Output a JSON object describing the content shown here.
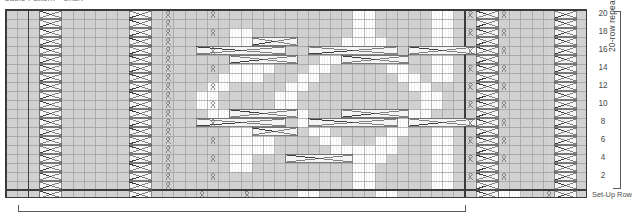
{
  "caption": "Cable Pattern - Chart",
  "chart_data": {
    "type": "table",
    "title": "Cable Pattern - Chart",
    "kind": "knitting-stitch-chart",
    "columns": 52,
    "rows": 21,
    "row_labels_side": "right",
    "row_tick_labels": [
      "20",
      "18",
      "16",
      "14",
      "12",
      "10",
      "8",
      "6",
      "4",
      "2"
    ],
    "setup_row_label": "Set-Up Row",
    "vertical_bracket_label": "20-row repeat",
    "horizontal_bracket_label": "",
    "grid": true,
    "colors": {
      "background": "#ffffff",
      "purl_cell": "#d2d2d2",
      "knit_cell": "#ffffff",
      "grid_line": "#9a9a9a",
      "bold_line": "#3b3b3b",
      "symbol_line": "#5a5a5a",
      "text": "#4a4a4a"
    },
    "legend": [
      {
        "symbol": "knit",
        "label": "knit"
      },
      {
        "symbol": "purl",
        "label": "purl"
      },
      {
        "symbol": "twist",
        "label": "twisted stitch"
      },
      {
        "symbol": "cable-right",
        "label": "right cross cable"
      },
      {
        "symbol": "cable-left",
        "label": "left cross cable"
      }
    ],
    "repeat_boundary_columns": [
      2,
      41
    ]
  },
  "cells": {
    "purl_field_columns": [
      0,
      1,
      2,
      3,
      4,
      5,
      6,
      7,
      8,
      9,
      10,
      11,
      12,
      13,
      14,
      15,
      16,
      17,
      18,
      19,
      20,
      21,
      22,
      23,
      24,
      25,
      26,
      27,
      28,
      29,
      30,
      31,
      32,
      33,
      34,
      35,
      36,
      37,
      38,
      39,
      40,
      41,
      42,
      43,
      44,
      45,
      46,
      47,
      48,
      49,
      50,
      51
    ]
  }
}
